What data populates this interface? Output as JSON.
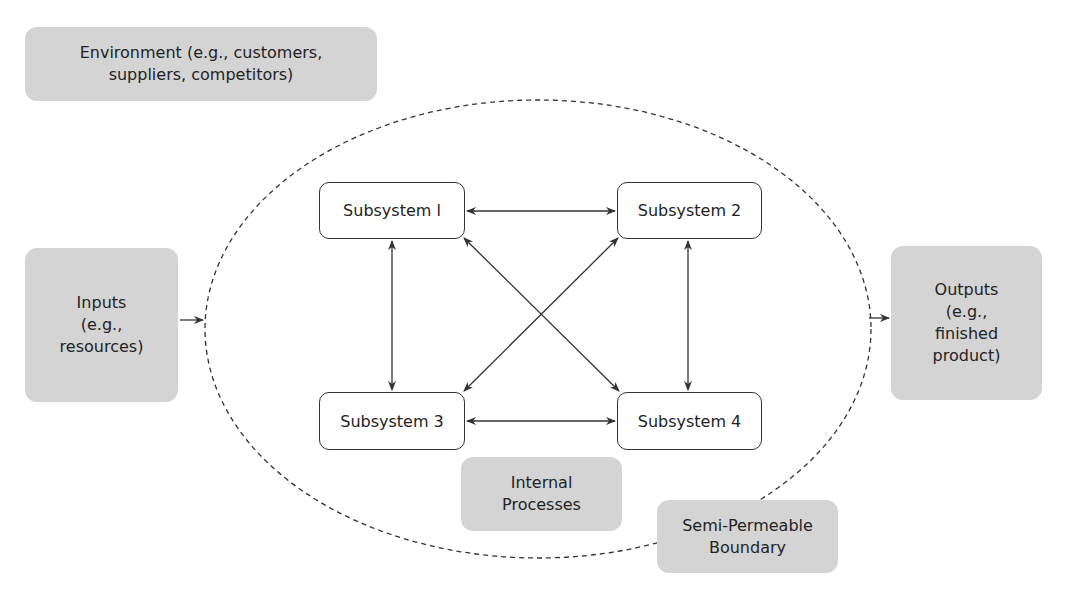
{
  "diagram": {
    "environment": "Environment (e.g., customers,\nsuppliers, competitors)",
    "inputs": "Inputs\n(e.g.,\nresources)",
    "outputs": "Outputs\n(e.g.,\nfinished\nproduct)",
    "internal_processes": "Internal\nProcesses",
    "boundary": "Semi-Permeable\nBoundary",
    "subsystems": [
      "Subsystem l",
      "Subsystem 2",
      "Subsystem 3",
      "Subsystem 4"
    ],
    "connections": [
      {
        "from": "Subsystem l",
        "to": "Subsystem 2",
        "type": "bidirectional"
      },
      {
        "from": "Subsystem l",
        "to": "Subsystem 3",
        "type": "bidirectional"
      },
      {
        "from": "Subsystem l",
        "to": "Subsystem 4",
        "type": "bidirectional"
      },
      {
        "from": "Subsystem 2",
        "to": "Subsystem 3",
        "type": "bidirectional"
      },
      {
        "from": "Subsystem 2",
        "to": "Subsystem 4",
        "type": "bidirectional"
      },
      {
        "from": "Subsystem 3",
        "to": "Subsystem 4",
        "type": "bidirectional"
      },
      {
        "from": "Inputs",
        "to": "Boundary",
        "type": "directed"
      },
      {
        "from": "Boundary",
        "to": "Outputs",
        "type": "directed"
      }
    ],
    "colors": {
      "box_fill": "#d4d4d4",
      "line": "#333333",
      "text": "#232323"
    }
  }
}
